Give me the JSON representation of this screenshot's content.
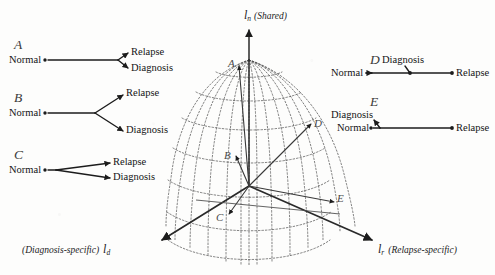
{
  "figure": {
    "background": "#fdfdfc",
    "ink": "#1c1c1c"
  },
  "axes": {
    "vertical": {
      "symbol": "l",
      "subscript": "n",
      "annotation": "(Shared)",
      "name": "shared-axis"
    },
    "left": {
      "symbol": "l",
      "subscript": "d",
      "annotation": "(Diagnosis-specific)",
      "name": "diagnosis-specific-axis"
    },
    "right": {
      "symbol": "l",
      "subscript": "r",
      "annotation": "(Relapse-specific)",
      "name": "relapse-specific-axis"
    }
  },
  "nodes": {
    "normal": "Normal",
    "relapse": "Relapse",
    "diagnosis": "Diagnosis"
  },
  "panels": [
    {
      "id": "A",
      "position": "left",
      "description": "late narrow split: long shared trunk then tight fork into Relapse and Diagnosis"
    },
    {
      "id": "B",
      "position": "left",
      "description": "mid-length trunk then wide fork into Relapse and Diagnosis"
    },
    {
      "id": "C",
      "position": "left",
      "description": "immediate split at Normal into shallow Relapse and Diagnosis branches"
    },
    {
      "id": "D",
      "position": "right",
      "description": "single horizontal axis Normal to Relapse with Diagnosis at an interior midpoint"
    },
    {
      "id": "E",
      "position": "right",
      "description": "Diagnosis adjacent above Normal, long horizontal branch to Relapse"
    }
  ],
  "sphere": {
    "type": "hemisphere-geodesic-grid",
    "meridians": 12,
    "parallels": 6,
    "grid_style": "dotted",
    "markers": [
      {
        "id": "A",
        "label_dx": -9,
        "label_dy": -4
      },
      {
        "id": "B",
        "label_dx": -11,
        "label_dy": -3
      },
      {
        "id": "C",
        "label_dx": -11,
        "label_dy": 2
      },
      {
        "id": "D",
        "label_dx": 5,
        "label_dy": -3
      },
      {
        "id": "E",
        "label_dx": 4,
        "label_dy": -5
      }
    ]
  }
}
